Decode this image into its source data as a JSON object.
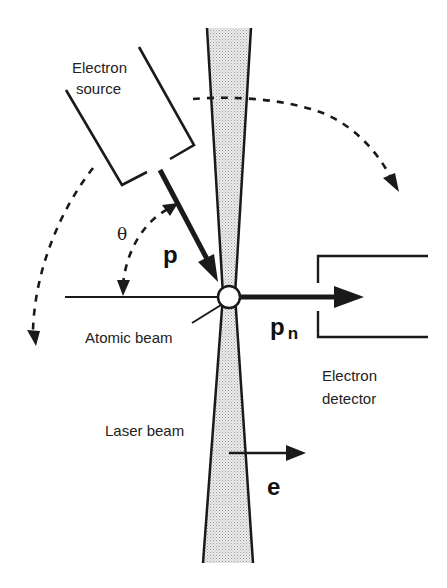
{
  "diagram": {
    "colors": {
      "ink": "#1a1a1a",
      "laser_fill": "#d8d8d8",
      "background": "#ffffff"
    },
    "labels": {
      "source_line1": "Electron",
      "source_line2": "source",
      "theta": "θ",
      "p": "p",
      "pn_main": "p",
      "pn_sub": "n",
      "atomic_beam": "Atomic beam",
      "detector_line1": "Electron",
      "detector_line2": "detector",
      "laser_beam": "Laser beam",
      "e": "e"
    },
    "components": [
      {
        "id": "electron-source",
        "label": "Electron source"
      },
      {
        "id": "electron-detector",
        "label": "Electron detector"
      },
      {
        "id": "laser-beam",
        "label": "Laser beam"
      },
      {
        "id": "atomic-beam",
        "label": "Atomic beam"
      },
      {
        "id": "interaction-point",
        "label": ""
      }
    ],
    "vectors": [
      {
        "id": "p",
        "label": "p",
        "description": "incident electron momentum"
      },
      {
        "id": "pn",
        "label": "p_n",
        "description": "scattered electron momentum toward detector"
      },
      {
        "id": "e",
        "label": "e",
        "description": "laser polarization vector"
      }
    ],
    "angles": [
      {
        "id": "theta",
        "label": "θ",
        "description": "angle between p and atomic beam axis"
      }
    ]
  }
}
